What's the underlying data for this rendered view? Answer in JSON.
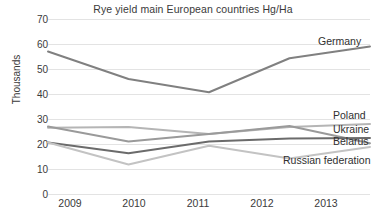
{
  "chart_data": {
    "type": "line",
    "title": "Rye yield main European countries Hg/Ha",
    "xlabel": "",
    "ylabel": "Thousands",
    "x": [
      "2009",
      "2010",
      "2011",
      "2012",
      "2013"
    ],
    "categories": [
      "2009",
      "2010",
      "2011",
      "2012",
      "2013"
    ],
    "ylim": [
      0,
      70
    ],
    "yticks": [
      "0",
      "10",
      "20",
      "30",
      "40",
      "50",
      "60",
      "70"
    ],
    "grid": "horizontal",
    "legend_position": "right-inline-labels",
    "series": [
      {
        "name": "Germany",
        "color": "#808080",
        "values": [
          57,
          46,
          40.7,
          54.3,
          59
        ]
      },
      {
        "name": "Poland",
        "color": "#b5b5b5",
        "values": [
          26.5,
          26.8,
          24,
          26.8,
          28
        ]
      },
      {
        "name": "Ukraine",
        "color": "#9a9a9a",
        "values": [
          27,
          21,
          24,
          27.2,
          20.3
        ]
      },
      {
        "name": "Belarus",
        "color": "#6b6b6b",
        "values": [
          20.6,
          16.3,
          21,
          22.2,
          22.4
        ]
      },
      {
        "name": "Russian federation",
        "color": "#c3c3c3",
        "values": [
          20.6,
          11.8,
          19.3,
          14.2,
          18.8
        ]
      }
    ]
  },
  "colors": {
    "axis_text": "#3a3a3a",
    "gridline": "#e3e3e3",
    "background": "#ffffff"
  }
}
